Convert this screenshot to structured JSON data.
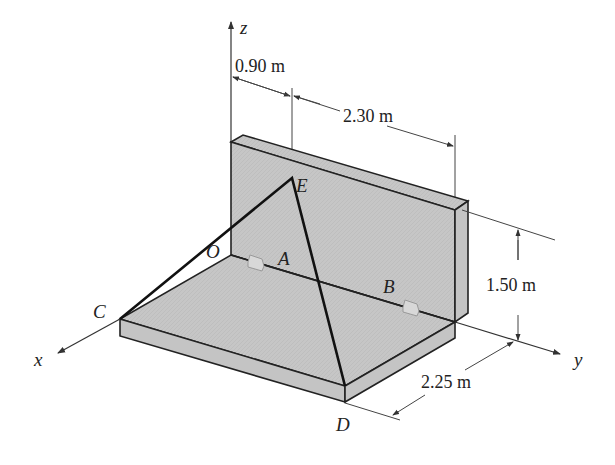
{
  "diagram": {
    "type": "statics-3d-rigid-body",
    "axes": {
      "x": "x",
      "y": "y",
      "z": "z"
    },
    "points": {
      "origin": "O",
      "hinge_a": "A",
      "hinge_b": "B",
      "cable_end_c": "C",
      "cable_apex_e": "E",
      "cable_end_d": "D"
    },
    "dimensions": {
      "oe_offset": "0.90 m",
      "wall_length": "2.30 m",
      "wall_height": "1.50 m",
      "plate_width": "2.25 m"
    },
    "colors": {
      "surface": "#c8c8c8",
      "edge": "#222222",
      "cable": "#111111",
      "dimension_line": "#444444"
    }
  }
}
